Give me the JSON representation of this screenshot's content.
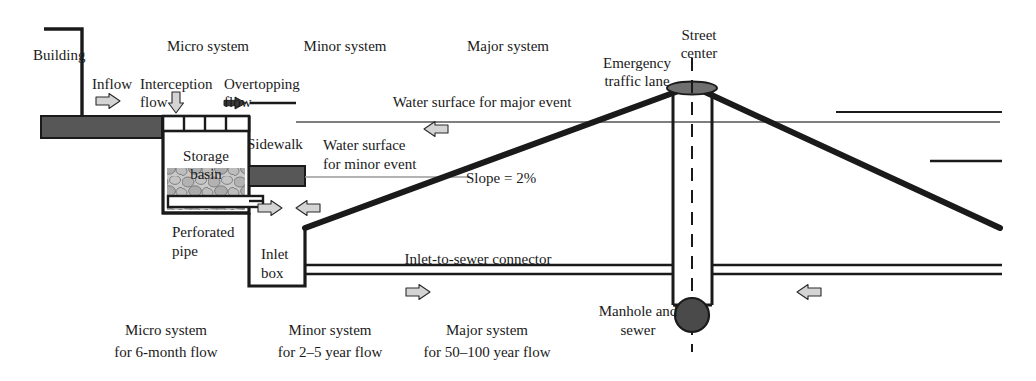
{
  "diagram": {
    "colors": {
      "ink": "#1a1a1a",
      "slab_fill": "#575757",
      "gravel_fill": "#b8b8b8",
      "arrow_light_fill": "#d4d4d4",
      "arrow_dark_fill": "#3a3a3a",
      "manhole_fill": "#4a4a4a",
      "water_line": "#8d8d8d",
      "background": "#ffffff"
    }
  },
  "header_labels": {
    "micro": "Micro system",
    "minor": "Minor system",
    "major": "Major system"
  },
  "footer_labels": [
    {
      "line1": "Micro system",
      "line2": "for 6-month flow"
    },
    {
      "line1": "Minor system",
      "line2": "for 2–5 year flow"
    },
    {
      "line1": "Major system",
      "line2": "for 50–100 year flow"
    }
  ],
  "callouts": {
    "building": "Building",
    "inflow": "Inflow",
    "interception_l1": "Interception",
    "interception_l2": "flow",
    "overtopping_l1": "Overtopping",
    "overtopping_l2": "flow",
    "storage_l1": "Storage",
    "storage_l2": "basin",
    "perforated_l1": "Perforated",
    "perforated_l2": "pipe",
    "sidewalk": "Sidewalk",
    "inlet_l1": "Inlet",
    "inlet_l2": "box",
    "water_major": "Water surface for major event",
    "water_minor_l1": "Water surface",
    "water_minor_l2": "for minor event",
    "slope": "Slope = 2%",
    "emergency_l1": "Emergency",
    "emergency_l2": "traffic lane",
    "street_l1": "Street",
    "street_l2": "center",
    "connector": "Inlet-to-sewer connector",
    "manhole_l1": "Manhole and",
    "manhole_l2": "sewer"
  },
  "geometry": {
    "street_crown_x": 692,
    "street_crown_y": 86,
    "slope_percent": 2
  }
}
